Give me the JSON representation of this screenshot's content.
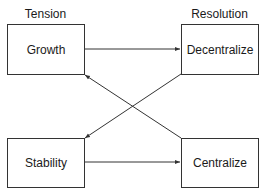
{
  "diagram": {
    "columns": {
      "left_header": "Tension",
      "right_header": "Resolution"
    },
    "nodes": [
      {
        "id": "growth",
        "label": "Growth",
        "column": "Tension",
        "row": 1
      },
      {
        "id": "decentralize",
        "label": "Decentralize",
        "column": "Resolution",
        "row": 1
      },
      {
        "id": "stability",
        "label": "Stability",
        "column": "Tension",
        "row": 2
      },
      {
        "id": "centralize",
        "label": "Centralize",
        "column": "Resolution",
        "row": 2
      }
    ],
    "edges": [
      {
        "from": "growth",
        "to": "decentralize"
      },
      {
        "from": "stability",
        "to": "centralize"
      },
      {
        "from": "decentralize",
        "to": "stability"
      },
      {
        "from": "centralize",
        "to": "growth"
      }
    ],
    "colors": {
      "line": "#333333",
      "background": "#ffffff",
      "text": "#1a1a1a"
    }
  }
}
